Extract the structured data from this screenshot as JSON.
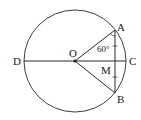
{
  "diagram": {
    "type": "geometry-circle",
    "colors": {
      "stroke": "#2a2a2a",
      "background": "#ffffff"
    },
    "circle": {
      "center": "O",
      "cx": 75,
      "cy": 61,
      "r": 51
    },
    "points": {
      "A": {
        "label": "A",
        "x": 115,
        "y": 30
      },
      "B": {
        "label": "B",
        "x": 115,
        "y": 93
      },
      "C": {
        "label": "C",
        "x": 126,
        "y": 61
      },
      "D": {
        "label": "D",
        "x": 24,
        "y": 61
      },
      "O": {
        "label": "O",
        "x": 75,
        "y": 61
      },
      "M": {
        "label": "M",
        "x": 115,
        "y": 61
      }
    },
    "segments": [
      "DC",
      "OA",
      "OB",
      "AB"
    ],
    "angle": {
      "vertex": "A",
      "between": [
        "OA",
        "AB"
      ],
      "label": "60°"
    },
    "equal_marks": [
      "AM",
      "MB"
    ]
  }
}
